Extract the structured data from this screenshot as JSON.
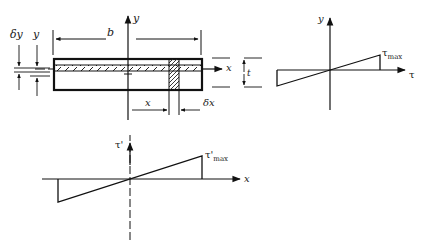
{
  "figure": {
    "section": {
      "width_label": "b",
      "thickness_label": "t",
      "strip_thickness_label": "δy",
      "strip_position_label": "y",
      "element_position_label": "x",
      "element_width_label": "δx",
      "x_axis_label": "x",
      "y_axis_label": "y"
    },
    "stress_across_thickness": {
      "y_axis_label": "y",
      "x_axis_label": "τ",
      "max_label": "τ",
      "max_subscript": "max"
    },
    "stress_along_width": {
      "y_axis_label": "τ'",
      "x_axis_label": "x",
      "max_label": "τ'",
      "max_subscript": "max"
    }
  }
}
